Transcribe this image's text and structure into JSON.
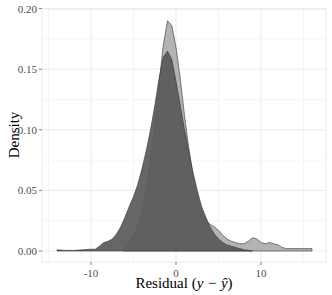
{
  "chart_data": {
    "type": "area",
    "title": "",
    "xlabel": "Residual (y − ŷ)",
    "ylabel": "Density",
    "xlim": [
      -15.5,
      17.5
    ],
    "ylim": [
      -0.009,
      0.2
    ],
    "x_ticks": [
      -10,
      0,
      10
    ],
    "x_tick_labels": [
      "-10",
      "0",
      "10"
    ],
    "y_ticks": [
      0.0,
      0.05,
      0.1,
      0.15,
      0.2
    ],
    "y_tick_labels": [
      "0.00",
      "0.05",
      "0.10",
      "0.15",
      "0.20"
    ],
    "grid": true,
    "legend": "none",
    "series": [
      {
        "name": "light",
        "color": "#b3b3b3",
        "x": [
          -6.2,
          -5.5,
          -5,
          -4.5,
          -4,
          -3.5,
          -3,
          -2.5,
          -2,
          -1.5,
          -1,
          -0.5,
          0,
          0.5,
          1,
          1.5,
          2,
          2.5,
          3,
          3.5,
          4,
          4.5,
          5,
          5.5,
          6,
          6.5,
          7,
          7.5,
          8,
          8.5,
          9,
          9.5,
          10,
          10.5,
          11,
          11.5,
          12,
          12.5,
          13,
          13.5,
          14,
          14.5,
          15,
          15.5,
          16
        ],
        "y": [
          0.0,
          0.006,
          0.012,
          0.02,
          0.032,
          0.05,
          0.073,
          0.103,
          0.138,
          0.17,
          0.19,
          0.186,
          0.168,
          0.142,
          0.112,
          0.085,
          0.062,
          0.044,
          0.032,
          0.025,
          0.022,
          0.02,
          0.017,
          0.013,
          0.01,
          0.008,
          0.007,
          0.006,
          0.006,
          0.008,
          0.011,
          0.01,
          0.007,
          0.006,
          0.007,
          0.006,
          0.005,
          0.003,
          0.002,
          0.002,
          0.002,
          0.002,
          0.002,
          0.002,
          0.002
        ]
      },
      {
        "name": "dark",
        "color": "#595959",
        "x": [
          -14,
          -13,
          -12,
          -11,
          -10,
          -9.5,
          -9,
          -8.5,
          -8,
          -7.5,
          -7,
          -6.5,
          -6,
          -5.5,
          -5,
          -4.5,
          -4,
          -3.5,
          -3,
          -2.5,
          -2,
          -1.5,
          -1,
          -0.5,
          0,
          0.5,
          1,
          1.5,
          2,
          2.5,
          3,
          3.5,
          4,
          4.5,
          5,
          5.5,
          6,
          6.5,
          7,
          7.5,
          8,
          8.5,
          9
        ],
        "y": [
          0.001,
          0.0005,
          0.0005,
          0.001,
          0.0015,
          0.0015,
          0.004,
          0.007,
          0.008,
          0.01,
          0.014,
          0.02,
          0.028,
          0.037,
          0.045,
          0.055,
          0.068,
          0.083,
          0.1,
          0.12,
          0.142,
          0.16,
          0.165,
          0.158,
          0.14,
          0.12,
          0.1,
          0.082,
          0.065,
          0.05,
          0.037,
          0.028,
          0.02,
          0.014,
          0.01,
          0.007,
          0.005,
          0.004,
          0.003,
          0.002,
          0.001,
          0.0005,
          0.0
        ]
      }
    ]
  }
}
